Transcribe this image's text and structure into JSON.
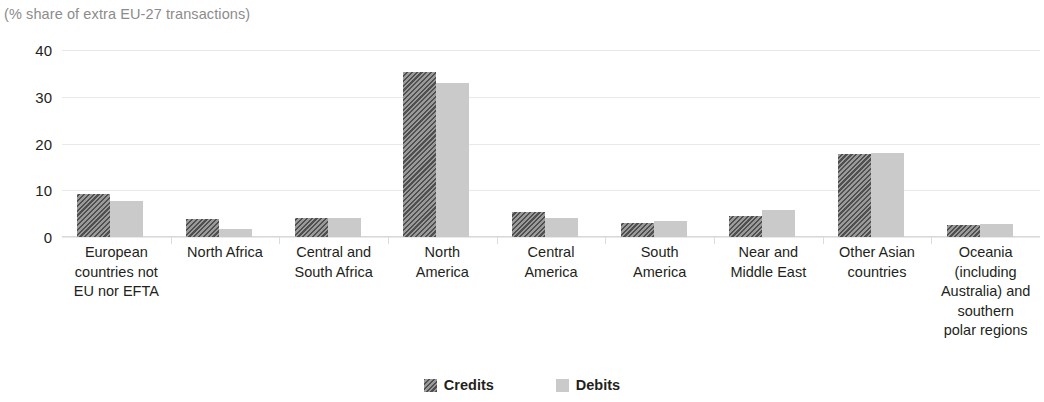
{
  "chart_data": {
    "type": "bar",
    "title": "",
    "subtitle": "(% share of extra EU-27 transactions)",
    "xlabel": "",
    "ylabel": "",
    "ylim": [
      0,
      40
    ],
    "yticks": [
      0,
      10,
      20,
      30,
      40
    ],
    "grid": true,
    "legend_position": "bottom",
    "categories": [
      "European countries not EU nor EFTA",
      "North Africa",
      "Central and South Africa",
      "North America",
      "Central America",
      "South America",
      "Near and Middle East",
      "Other Asian countries",
      "Oceania (including Australia) and southern polar regions"
    ],
    "category_lines": [
      [
        "European",
        "countries not",
        "EU nor EFTA"
      ],
      [
        "North Africa"
      ],
      [
        "Central and",
        "South Africa"
      ],
      [
        "North",
        "America"
      ],
      [
        "Central",
        "America"
      ],
      [
        "South",
        "America"
      ],
      [
        "Near and",
        "Middle East"
      ],
      [
        "Other Asian",
        "countries"
      ],
      [
        "Oceania",
        "(including",
        "Australia) and",
        "southern",
        "polar regions"
      ]
    ],
    "series": [
      {
        "name": "Credits",
        "color": "#8b8b8b",
        "pattern": "diagonal-hatch",
        "values": [
          9.3,
          3.9,
          4.1,
          35.2,
          5.3,
          3.1,
          4.4,
          17.8,
          2.5
        ]
      },
      {
        "name": "Debits",
        "color": "#cacaca",
        "pattern": "solid",
        "values": [
          7.6,
          1.8,
          4.1,
          33.0,
          4.1,
          3.5,
          5.7,
          18.0,
          2.8
        ]
      }
    ]
  },
  "legend": {
    "items": [
      {
        "label": "Credits",
        "swatch": "hatched-dark-gray-swatch"
      },
      {
        "label": "Debits",
        "swatch": "light-gray-swatch"
      }
    ]
  },
  "axis": {
    "y_tick_labels": [
      "40",
      "30",
      "20",
      "10",
      "0"
    ]
  }
}
